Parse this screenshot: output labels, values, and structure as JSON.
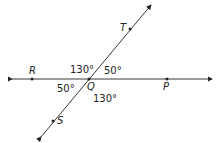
{
  "diagram": {
    "points": [
      {
        "name": "R",
        "x": 32,
        "y": 79
      },
      {
        "name": "Q",
        "x": 89,
        "y": 79
      },
      {
        "name": "P",
        "x": 167,
        "y": 79
      },
      {
        "name": "T",
        "x": 130,
        "y": 29
      },
      {
        "name": "S",
        "x": 53,
        "y": 121
      }
    ],
    "lines": [
      {
        "name": "line RP",
        "from": [
          10,
          79
        ],
        "to": [
          213,
          79
        ],
        "arrows": "both"
      },
      {
        "name": "line ST",
        "from": [
          40,
          139
        ],
        "to": [
          152,
          4
        ],
        "arrows": "both"
      }
    ],
    "angles": {
      "TQP": "50°",
      "RQT": "130°",
      "RQS": "50°",
      "SQP": "130°"
    },
    "colors": {
      "line": "#222222",
      "background": "#ffffff"
    }
  }
}
